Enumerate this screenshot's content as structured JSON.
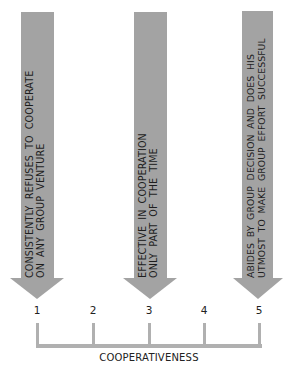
{
  "diagram": {
    "type": "rating-scale",
    "axis_label": "COOPERATIVENESS",
    "scale": [
      "1",
      "2",
      "3",
      "4",
      "5"
    ],
    "anchors": [
      {
        "position": "1",
        "lines": [
          "CONSISTENTLY  REFUSES  TO  COOPERATE",
          "ON  ANY  GROUP  VENTURE"
        ]
      },
      {
        "position": "3",
        "lines": [
          "EFFECTIVE  IN  COOPERATION",
          "ONLY  PART  OF  THE  TIME"
        ]
      },
      {
        "position": "5",
        "lines": [
          "ABIDES  BY  GROUP  DECISION  AND  DOES  HIS",
          "UTMOST  TO  MAKE  GROUP  EFFORT  SUCCESSFUL"
        ]
      }
    ],
    "colors": {
      "arrow": "#a3a3a3",
      "scale_line": "#b0b0b0",
      "text": "#1e1e1e"
    }
  }
}
